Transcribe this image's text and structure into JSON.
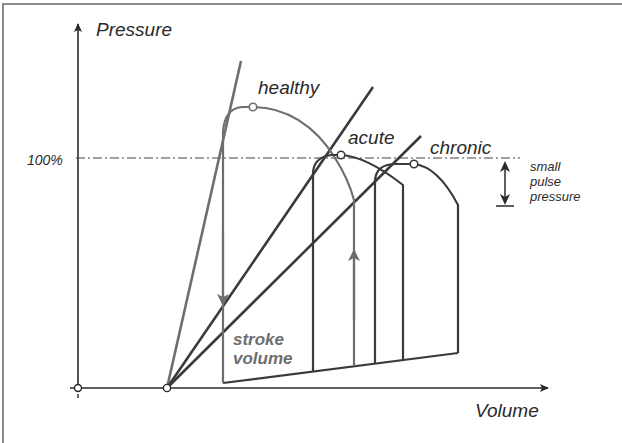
{
  "diagram": {
    "axes": {
      "y_label": "Pressure",
      "x_label": "Volume",
      "reference_line_label": "100%"
    },
    "loops": [
      {
        "name": "healthy",
        "label": "healthy",
        "color": "#6e6e6e"
      },
      {
        "name": "acute",
        "label": "acute",
        "color": "#3a3a3a"
      },
      {
        "name": "chronic",
        "label": "chronic",
        "color": "#3a3a3a"
      }
    ],
    "annotations": {
      "small_pulse_pressure": [
        "small",
        "pulse",
        "pressure"
      ],
      "stroke_volume": [
        "stroke",
        "volume"
      ]
    },
    "colors": {
      "axis": "#2a2a2a",
      "healthy": "#6e6e6e",
      "pathology": "#3a3a3a",
      "reference_line": "#444444",
      "frame": "#8a8a8a"
    }
  }
}
